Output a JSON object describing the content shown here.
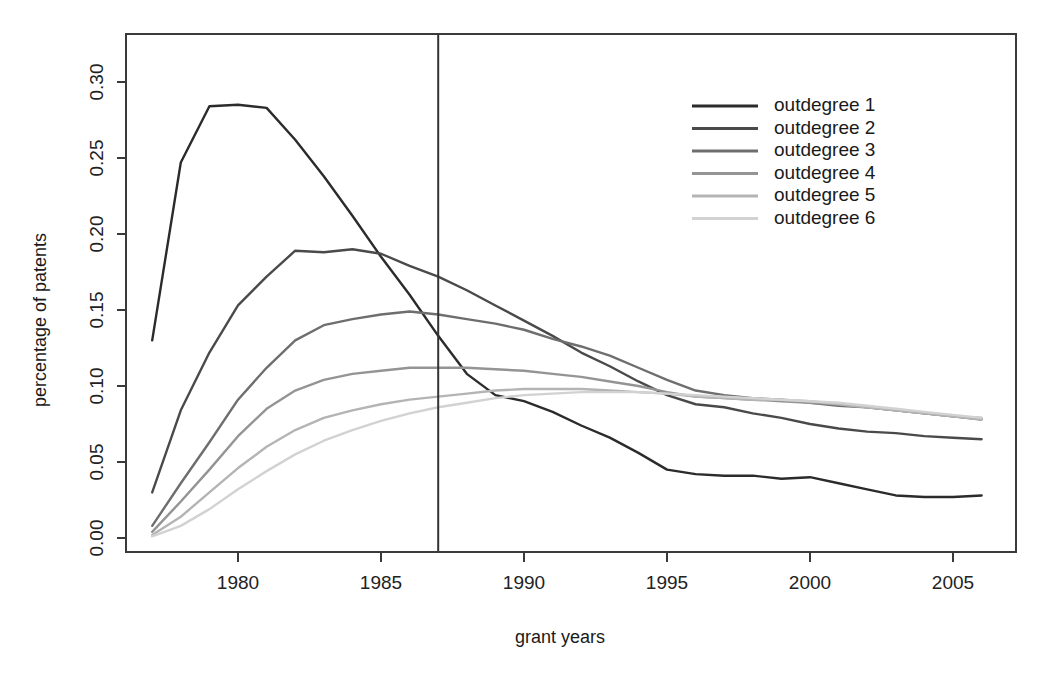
{
  "chart_data": {
    "type": "line",
    "title": "",
    "xlabel": "grant years",
    "ylabel": "percentage of patents",
    "xlim": [
      1977,
      2006
    ],
    "ylim": [
      0.0,
      0.305
    ],
    "grid": false,
    "legend_position": "top-right",
    "x": [
      1977,
      1978,
      1979,
      1980,
      1981,
      1982,
      1983,
      1984,
      1985,
      1986,
      1987,
      1988,
      1989,
      1990,
      1991,
      1992,
      1993,
      1994,
      1995,
      1996,
      1997,
      1998,
      1999,
      2000,
      2001,
      2002,
      2003,
      2004,
      2005,
      2006
    ],
    "yticks": [
      0.0,
      0.05,
      0.1,
      0.15,
      0.2,
      0.25,
      0.3
    ],
    "ytick_labels": [
      "0.00",
      "0.05",
      "0.10",
      "0.15",
      "0.20",
      "0.25",
      "0.30"
    ],
    "xticks": [
      1980,
      1985,
      1990,
      1995,
      2000,
      2005
    ],
    "xtick_labels": [
      "1980",
      "1985",
      "1990",
      "1995",
      "2000",
      "2005"
    ],
    "annotations": [
      {
        "name": "vertical-reference-line",
        "type": "vline",
        "x": 1987,
        "color": "#333333"
      }
    ],
    "colors": [
      "#2b2b2b",
      "#4a4a4a",
      "#6e6e6e",
      "#949494",
      "#b4b4b4",
      "#d2d2d2"
    ],
    "series": [
      {
        "name": "outdegree 1",
        "color": "#2b2b2b",
        "values": [
          0.13,
          0.247,
          0.284,
          0.285,
          0.283,
          0.262,
          0.238,
          0.212,
          0.185,
          0.16,
          0.133,
          0.108,
          0.094,
          0.09,
          0.083,
          0.074,
          0.066,
          0.056,
          0.045,
          0.042,
          0.041,
          0.041,
          0.039,
          0.04,
          0.036,
          0.032,
          0.028,
          0.027,
          0.027,
          0.028
        ]
      },
      {
        "name": "outdegree 2",
        "color": "#4a4a4a",
        "values": [
          0.03,
          0.084,
          0.122,
          0.153,
          0.172,
          0.189,
          0.188,
          0.19,
          0.187,
          0.179,
          0.172,
          0.163,
          0.153,
          0.143,
          0.133,
          0.122,
          0.113,
          0.103,
          0.094,
          0.088,
          0.086,
          0.082,
          0.079,
          0.075,
          0.072,
          0.07,
          0.069,
          0.067,
          0.066,
          0.065
        ]
      },
      {
        "name": "outdegree 3",
        "color": "#6e6e6e",
        "values": [
          0.008,
          0.036,
          0.063,
          0.091,
          0.112,
          0.13,
          0.14,
          0.144,
          0.147,
          0.149,
          0.147,
          0.144,
          0.141,
          0.137,
          0.131,
          0.126,
          0.12,
          0.112,
          0.104,
          0.097,
          0.094,
          0.092,
          0.091,
          0.089,
          0.087,
          0.086,
          0.084,
          0.082,
          0.08,
          0.078
        ]
      },
      {
        "name": "outdegree 4",
        "color": "#949494",
        "values": [
          0.004,
          0.024,
          0.045,
          0.067,
          0.085,
          0.097,
          0.104,
          0.108,
          0.11,
          0.112,
          0.112,
          0.112,
          0.111,
          0.11,
          0.108,
          0.106,
          0.103,
          0.1,
          0.096,
          0.093,
          0.092,
          0.091,
          0.09,
          0.089,
          0.088,
          0.086,
          0.084,
          0.082,
          0.08,
          0.079
        ]
      },
      {
        "name": "outdegree 5",
        "color": "#b4b4b4",
        "values": [
          0.002,
          0.014,
          0.03,
          0.046,
          0.06,
          0.071,
          0.079,
          0.084,
          0.088,
          0.091,
          0.093,
          0.095,
          0.097,
          0.098,
          0.098,
          0.098,
          0.097,
          0.096,
          0.095,
          0.093,
          0.092,
          0.091,
          0.091,
          0.09,
          0.088,
          0.086,
          0.084,
          0.082,
          0.08,
          0.078
        ]
      },
      {
        "name": "outdegree 6",
        "color": "#d2d2d2",
        "values": [
          0.001,
          0.008,
          0.019,
          0.032,
          0.044,
          0.055,
          0.064,
          0.071,
          0.077,
          0.082,
          0.086,
          0.089,
          0.092,
          0.094,
          0.095,
          0.096,
          0.096,
          0.096,
          0.095,
          0.094,
          0.093,
          0.092,
          0.091,
          0.09,
          0.089,
          0.087,
          0.085,
          0.083,
          0.081,
          0.079
        ]
      }
    ]
  },
  "legend": {
    "items": [
      {
        "label": "outdegree 1"
      },
      {
        "label": "outdegree 2"
      },
      {
        "label": "outdegree 3"
      },
      {
        "label": "outdegree 4"
      },
      {
        "label": "outdegree 5"
      },
      {
        "label": "outdegree 6"
      }
    ]
  },
  "axes": {
    "xlabel": "grant years",
    "ylabel": "percentage of patents"
  }
}
